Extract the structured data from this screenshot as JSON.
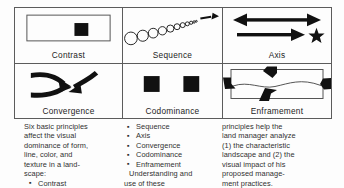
{
  "figure": {
    "cells": [
      {
        "id": "contrast",
        "label": "Contrast",
        "art": "rectangle-with-dark-square",
        "description": "Outlined horizontal rectangle containing one solid black square right of center"
      },
      {
        "id": "sequence",
        "label": "Sequence",
        "art": "diminishing-circles-with-arrow",
        "description": "A diagonal row of circles diminishing in size toward the upper right ending in an arrow"
      },
      {
        "id": "axis",
        "label": "Axis",
        "art": "double-arrow-and-arrow-to-star",
        "description": "A horizontal double headed arrow above a single arrow pointing at a star"
      },
      {
        "id": "convergence",
        "label": "Convergence",
        "art": "three-curved-arrows-converging",
        "description": "Three thick curved arrows converging on a single point"
      },
      {
        "id": "codominance",
        "label": "Codominance",
        "art": "two-equal-dark-squares",
        "description": "Two equally sized solid black squares side by side"
      },
      {
        "id": "enframement",
        "label": "Enframement",
        "art": "frame-with-inward-arrows",
        "description": "An open rectangle framing a wavy horizon line with four thick arrows pointing inward"
      }
    ]
  },
  "caption": {
    "column1": {
      "lines": [
        "Six basic principles",
        "affect the visual",
        "dominance of form,",
        "line, color, and",
        "texture in a land-",
        "scape:"
      ],
      "bullets": [
        "Contrast"
      ]
    },
    "column2": {
      "bullets": [
        "Sequence",
        "Axis",
        "Convergence",
        "Codominance",
        "Enframement"
      ],
      "lines": [
        "Understanding and",
        "use of these"
      ]
    },
    "column3": {
      "lines": [
        "principles help the",
        "land manager analyze",
        "(1) the characteristic",
        "landscape and (2) the",
        "visual impact of his",
        "proposed manage-",
        "ment practices."
      ]
    }
  },
  "colors": {
    "ink": "#111111",
    "border": "#5c5c5c",
    "text": "#303030",
    "background": "#fdfdfd"
  }
}
